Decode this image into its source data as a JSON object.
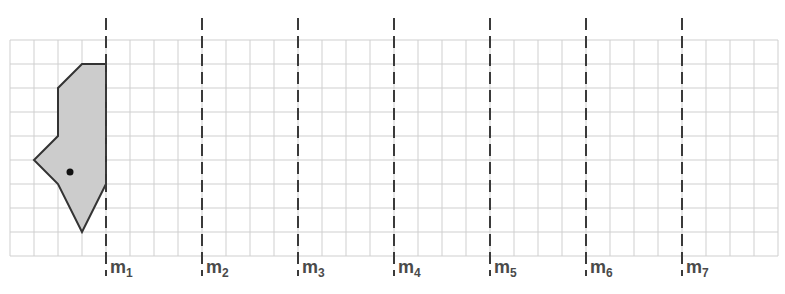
{
  "diagram": {
    "grid": {
      "left": 10,
      "top": 40,
      "cell": 24,
      "cols": 32,
      "rows": 9,
      "line_color": "#cfcfcf"
    },
    "mirror_lines": {
      "color": "#3a3a3a",
      "y_start": 18,
      "y_end": 276,
      "dash": "12 6",
      "lines": [
        {
          "x": 106,
          "name": "m",
          "sub": "1"
        },
        {
          "x": 202,
          "name": "m",
          "sub": "2"
        },
        {
          "x": 298,
          "name": "m",
          "sub": "3"
        },
        {
          "x": 394,
          "name": "m",
          "sub": "4"
        },
        {
          "x": 490,
          "name": "m",
          "sub": "5"
        },
        {
          "x": 586,
          "name": "m",
          "sub": "6"
        },
        {
          "x": 682,
          "name": "m",
          "sub": "7"
        }
      ]
    },
    "shape": {
      "fill": "#cccccc",
      "stroke": "#333333",
      "points": [
        [
          82,
          64
        ],
        [
          106,
          64
        ],
        [
          106,
          184
        ],
        [
          82,
          232
        ],
        [
          58,
          184
        ],
        [
          34,
          160
        ],
        [
          58,
          136
        ],
        [
          58,
          88
        ]
      ],
      "dot": {
        "x": 70,
        "y": 172,
        "r": 3.5,
        "color": "#111111"
      }
    }
  }
}
